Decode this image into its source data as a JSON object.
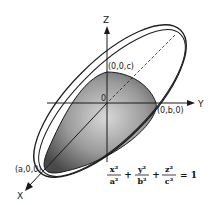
{
  "diagram": {
    "axes": {
      "z_label": "Z",
      "y_label": "Y",
      "x_label": "X",
      "origin_label": "0"
    },
    "points": {
      "z_intercept": "(0,0,c)",
      "y_intercept": "(0,b,0)",
      "x_intercept": "(a,0,0)"
    },
    "equation": {
      "term1_num": "x²",
      "term1_den": "a²",
      "term2_num": "y²",
      "term2_den": "b²",
      "term3_num": "z²",
      "term3_den": "c²",
      "plus": "+",
      "equals": "= 1"
    },
    "colors": {
      "outline": "#1a1a1a",
      "shade_dark": "#555555",
      "shade_light": "#cfcfcf"
    }
  }
}
